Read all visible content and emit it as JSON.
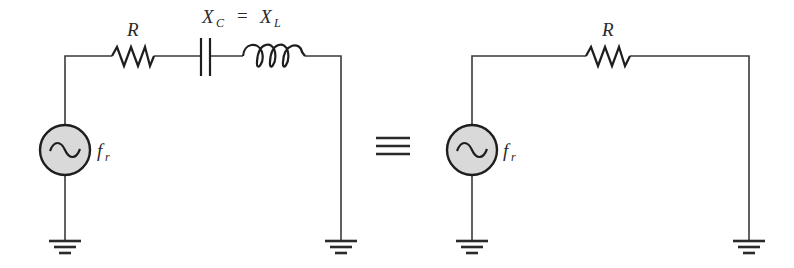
{
  "diagram": {
    "type": "circuit-equivalence",
    "left_circuit": {
      "components": [
        {
          "type": "ac-source",
          "label": "f",
          "label_sub": "r"
        },
        {
          "type": "resistor",
          "label": "R"
        },
        {
          "type": "capacitor",
          "label": "X",
          "label_sub": "C"
        },
        {
          "type": "inductor",
          "label": "X",
          "label_sub": "L"
        },
        {
          "type": "ground"
        },
        {
          "type": "ground"
        }
      ],
      "condition": {
        "lhs": "X",
        "lhs_sub": "C",
        "op": "=",
        "rhs": "X",
        "rhs_sub": "L"
      }
    },
    "equivalence_symbol": "≡",
    "right_circuit": {
      "components": [
        {
          "type": "ac-source",
          "label": "f",
          "label_sub": "r"
        },
        {
          "type": "resistor",
          "label": "R"
        },
        {
          "type": "ground"
        },
        {
          "type": "ground"
        }
      ]
    }
  },
  "labels": {
    "left_resistor": "R",
    "left_source": "f",
    "left_source_sub": "r",
    "xc": "X",
    "xc_sub": "C",
    "equals": "=",
    "xl": "X",
    "xl_sub": "L",
    "right_resistor": "R",
    "right_source": "f",
    "right_source_sub": "r"
  },
  "colors": {
    "line": "#1e1e1e",
    "source_fill": "#d9d9d9",
    "background": "#ffffff"
  }
}
